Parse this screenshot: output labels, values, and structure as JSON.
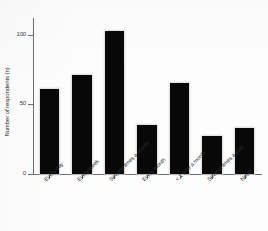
{
  "chart_data": {
    "type": "bar",
    "title": "",
    "subtitle": "",
    "xlabel": "",
    "ylabel": "Number of respondents (n)",
    "categories": [
      "Every day",
      "Every week",
      "Several times a month",
      "Every month",
      "< 1 time a month",
      "Several times a year",
      "Never"
    ],
    "values": [
      61,
      71,
      103,
      35,
      65,
      27,
      33
    ],
    "ylim": [
      0,
      112
    ],
    "yticks": [
      0,
      50,
      100
    ],
    "ytick_labels": [
      "0",
      "50",
      "100"
    ],
    "grid": false,
    "legend": null,
    "bar_color": "#080808",
    "axis_color": "#6e6e6e",
    "background_color": "#fdfdfd",
    "series": [
      {
        "name": "Number of respondents (n)",
        "values": [
          61,
          71,
          103,
          35,
          65,
          27,
          33
        ]
      }
    ]
  }
}
